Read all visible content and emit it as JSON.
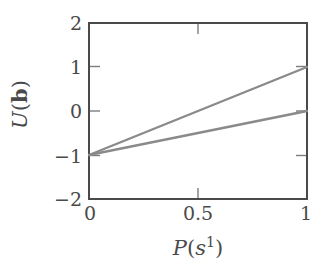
{
  "chart_data": {
    "type": "line",
    "title": "",
    "xlabel": "P(s^1)",
    "ylabel": "U(b)",
    "xlim": [
      0,
      1
    ],
    "ylim": [
      -2,
      2
    ],
    "grid": false,
    "legend": null,
    "xticks": [
      "0",
      "0.5",
      "1"
    ],
    "xtick_values": [
      0,
      0.5,
      1
    ],
    "yticks": [
      "2",
      "1",
      "0",
      "−1",
      "−2"
    ],
    "ytick_values": [
      2,
      1,
      0,
      -1,
      -2
    ],
    "line_color": "#8a8a8a",
    "axis_color": "#4a4a4a",
    "series": [
      {
        "name": "upper",
        "x": [
          0,
          1
        ],
        "values": [
          -1,
          1
        ],
        "slope": 2,
        "intercept": -1
      },
      {
        "name": "lower",
        "x": [
          0,
          1
        ],
        "values": [
          -1,
          0
        ],
        "slope": 1,
        "intercept": -1
      }
    ]
  },
  "axis_titles": {
    "y_main": "U",
    "y_open": "(",
    "y_bold": "b",
    "y_close": ")",
    "x_main": "P",
    "x_open": "(",
    "x_var": "s",
    "x_sup": "1",
    "x_close": ")"
  },
  "ticks": {
    "y": [
      {
        "label": "2",
        "value": 2
      },
      {
        "label": "1",
        "value": 1
      },
      {
        "label": "0",
        "value": 0
      },
      {
        "label": "−1",
        "value": -1
      },
      {
        "label": "−2",
        "value": -2
      }
    ],
    "x": [
      {
        "label": "0",
        "value": 0
      },
      {
        "label": "0.5",
        "value": 0.5
      },
      {
        "label": "1",
        "value": 1
      }
    ]
  }
}
